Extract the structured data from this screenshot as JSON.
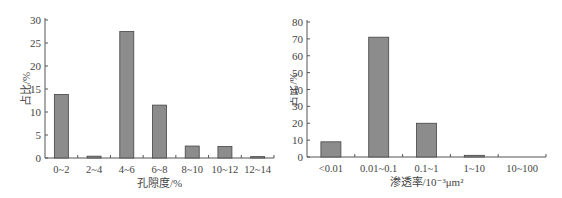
{
  "chart_data": [
    {
      "type": "bar",
      "title": "",
      "xlabel": "孔隙度/%",
      "ylabel": "占比/%",
      "categories": [
        "0~2",
        "2~4",
        "4~6",
        "6~8",
        "8~10",
        "10~12",
        "12~14"
      ],
      "values": [
        13.8,
        0.4,
        27.5,
        11.5,
        2.6,
        2.5,
        0.3
      ],
      "ylim": [
        0,
        30
      ],
      "yticks": [
        0,
        5,
        10,
        15,
        20,
        25,
        30
      ],
      "grid": false,
      "legend": null,
      "bar_color": "#8c8c8c"
    },
    {
      "type": "bar",
      "title": "",
      "xlabel": "渗透率/10⁻³μm²",
      "ylabel": "占比/%",
      "categories": [
        "<0.01",
        "0.01~0.1",
        "0.1~1",
        "1~10",
        "10~100"
      ],
      "values": [
        9,
        71,
        20,
        1,
        0
      ],
      "ylim": [
        0,
        80
      ],
      "yticks": [
        0,
        10,
        20,
        30,
        40,
        50,
        60,
        70,
        80
      ],
      "grid": false,
      "legend": null,
      "bar_color": "#8c8c8c"
    }
  ]
}
